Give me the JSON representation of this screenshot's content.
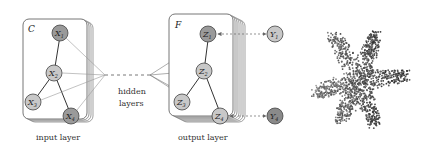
{
  "input_panel": {
    "frame_label": "C",
    "caption": "input layer",
    "nodes": [
      {
        "id": "X1",
        "base": "X",
        "sub": "1",
        "fill": "#9a9a9a"
      },
      {
        "id": "X2",
        "base": "X",
        "sub": "2",
        "fill": "#c8c8c8"
      },
      {
        "id": "X3",
        "base": "X",
        "sub": "3",
        "fill": "#c8c8c8"
      },
      {
        "id": "X4",
        "base": "X",
        "sub": "4",
        "fill": "#9a9a9a"
      }
    ]
  },
  "hidden": {
    "line1": "hidden",
    "line2": "layers"
  },
  "output_panel": {
    "frame_label": "F",
    "caption": "output layer",
    "nodes": [
      {
        "id": "Z1",
        "base": "Z",
        "sub": "1",
        "fill": "#9a9a9a"
      },
      {
        "id": "Z2",
        "base": "Z",
        "sub": "2",
        "fill": "#c8c8c8"
      },
      {
        "id": "Z3",
        "base": "Z",
        "sub": "3",
        "fill": "#c8c8c8"
      },
      {
        "id": "Z4",
        "base": "Z",
        "sub": "4",
        "fill": "#c8c8c8"
      }
    ],
    "targets": [
      {
        "id": "Y1",
        "base": "Y",
        "sub": "1",
        "fill": "#c8c8c8"
      },
      {
        "id": "Y4",
        "base": "Y",
        "sub": "4",
        "fill": "#8a8a8a"
      }
    ]
  },
  "embedding": {
    "description": "scatter plot of learned embeddings, star-shaped cluster"
  }
}
